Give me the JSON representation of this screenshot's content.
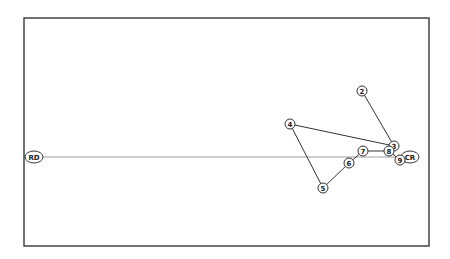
{
  "diagram": {
    "type": "ordination-trajectory",
    "frame": {
      "x": 24,
      "y": 18,
      "width": 405,
      "height": 228,
      "stroke": "#444444"
    },
    "axis_line": {
      "from": "RD",
      "to": "CR",
      "stroke": "#888888"
    },
    "nodes": [
      {
        "id": "RD",
        "label": "RD",
        "x": 34,
        "y": 157,
        "rx": 9,
        "ry": 6
      },
      {
        "id": "CR",
        "label": "CR",
        "x": 410,
        "y": 157,
        "rx": 9,
        "ry": 6
      },
      {
        "id": "2",
        "label": "2",
        "x": 362,
        "y": 91,
        "rx": 5,
        "ry": 5
      },
      {
        "id": "3",
        "label": "3",
        "x": 394,
        "y": 146,
        "rx": 5,
        "ry": 5
      },
      {
        "id": "4",
        "label": "4",
        "x": 290,
        "y": 124,
        "rx": 5,
        "ry": 5
      },
      {
        "id": "5",
        "label": "5",
        "x": 323,
        "y": 188,
        "rx": 5,
        "ry": 5
      },
      {
        "id": "6",
        "label": "6",
        "x": 349,
        "y": 163,
        "rx": 5,
        "ry": 5
      },
      {
        "id": "7",
        "label": "7",
        "x": 363,
        "y": 151,
        "rx": 5,
        "ry": 5
      },
      {
        "id": "8",
        "label": "8",
        "x": 389,
        "y": 151,
        "rx": 5,
        "ry": 5
      },
      {
        "id": "9",
        "label": "9",
        "x": 400,
        "y": 160,
        "rx": 5,
        "ry": 5
      }
    ],
    "edges": [
      {
        "from": "2",
        "to": "3"
      },
      {
        "from": "3",
        "to": "4"
      },
      {
        "from": "4",
        "to": "5"
      },
      {
        "from": "5",
        "to": "6"
      },
      {
        "from": "6",
        "to": "7"
      },
      {
        "from": "7",
        "to": "8"
      },
      {
        "from": "8",
        "to": "9"
      }
    ]
  }
}
